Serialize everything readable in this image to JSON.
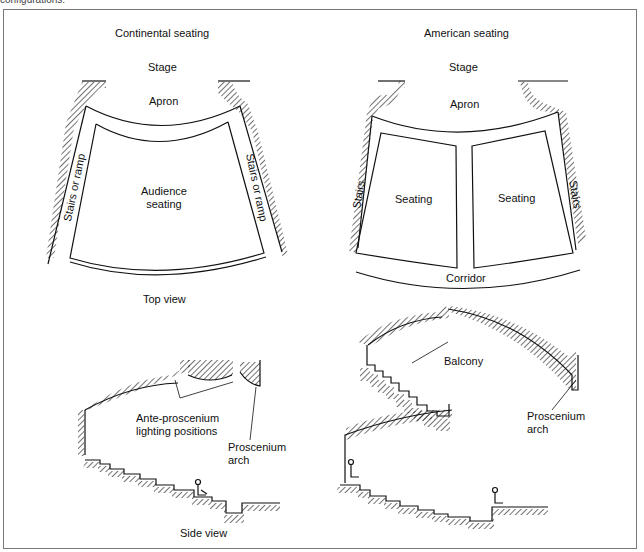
{
  "caption_fragment": "configurations:",
  "panels": {
    "continental": {
      "title": "Continental seating",
      "stage": "Stage",
      "apron": "Apron",
      "audience": [
        "Audience",
        "seating"
      ],
      "stairs_left": "Stairs or ramp",
      "stairs_right": "Stairs or ramp"
    },
    "american": {
      "title": "American seating",
      "stage": "Stage",
      "apron": "Apron",
      "seating_left": "Seating",
      "seating_right": "Seating",
      "stairs_left": "Stairs",
      "stairs_right": "Stairs",
      "corridor": "Corridor"
    },
    "top_view_label": "Top view",
    "side_left": {
      "ante": [
        "Ante-proscenium",
        "lighting positions"
      ],
      "proscenium": [
        "Proscenium",
        "arch"
      ]
    },
    "side_right": {
      "balcony": "Balcony",
      "proscenium": [
        "Proscenium",
        "arch"
      ]
    },
    "side_view_label": "Side view"
  }
}
